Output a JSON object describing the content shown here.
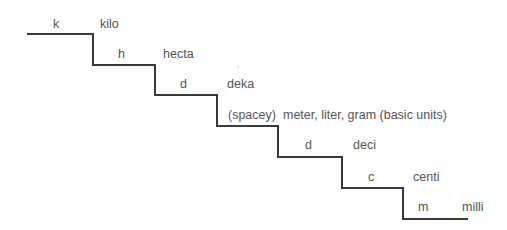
{
  "diagram": {
    "line_color": "#3a3a3a",
    "steps": [
      {
        "abbr": "k",
        "name": "kilo"
      },
      {
        "abbr": "h",
        "name": "hecta"
      },
      {
        "abbr": "d",
        "name": "deka"
      },
      {
        "abbr": "(spacey)",
        "name": "meter, liter, gram (basic units)"
      },
      {
        "abbr": "d",
        "name": "deci"
      },
      {
        "abbr": "c",
        "name": "centi"
      },
      {
        "abbr": "m",
        "name": "milli"
      }
    ]
  }
}
